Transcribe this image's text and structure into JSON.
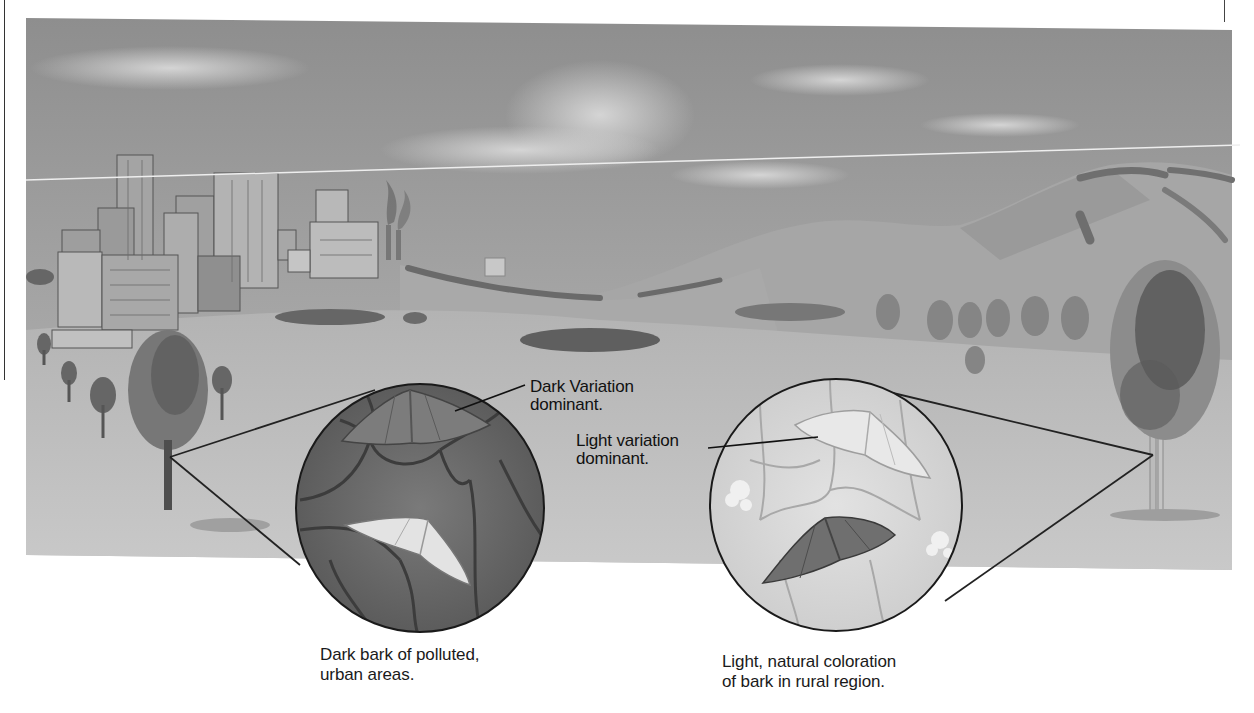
{
  "figure": {
    "topic": "Peppered moth industrial melanism — urban vs rural bark coloration",
    "colors": {
      "sky": "#9c9c9c",
      "sky_light": "#c8c8c8",
      "ground": "#b5b5b5",
      "hills": "#a3a3a3",
      "dark_bark": "#6e6e6e",
      "light_bark": "#dcdcdc",
      "dark_moth": "#777777",
      "light_moth": "#e6e6e6",
      "text": "#111111"
    },
    "scene": {
      "left_region": "polluted urban city with smokestacks",
      "right_region": "rural hills with trees"
    },
    "left_inset": {
      "pointer_label_line1": "Dark Variation",
      "pointer_label_line2": "dominant.",
      "caption_line1": "Dark bark of polluted,",
      "caption_line2": "urban areas."
    },
    "right_inset": {
      "pointer_label_line1": "Light variation",
      "pointer_label_line2": "dominant.",
      "caption_line1": "Light, natural coloration",
      "caption_line2": "of bark in rural region."
    }
  }
}
